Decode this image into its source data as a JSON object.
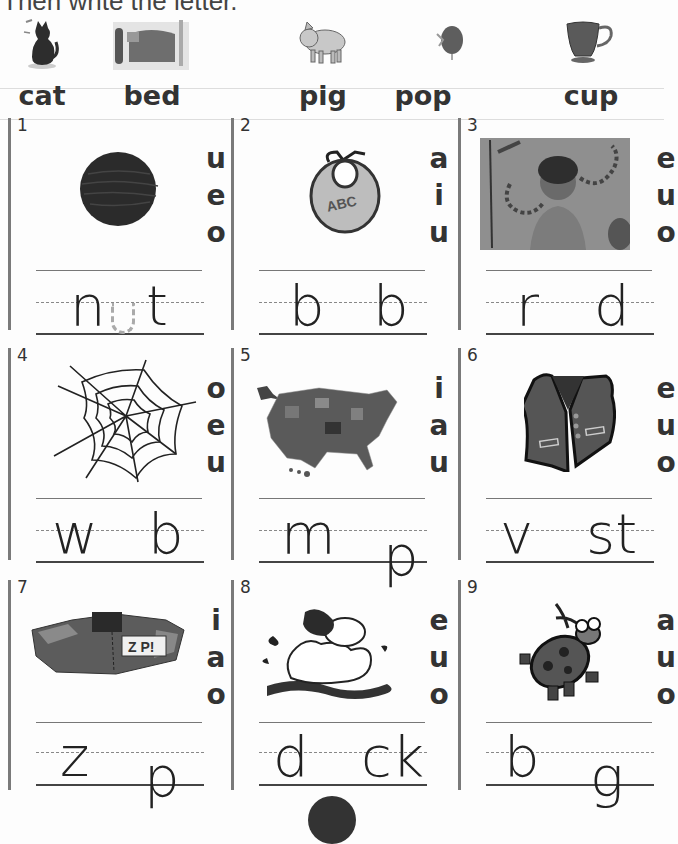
{
  "instruction": "Then write the letter.",
  "key_words": [
    {
      "word": "cat",
      "picture": "cat-icon"
    },
    {
      "word": "bed",
      "picture": "bed-icon"
    },
    {
      "word": "pig",
      "picture": "pig-icon"
    },
    {
      "word": "pop",
      "picture": "balloon-pop-icon"
    },
    {
      "word": "cup",
      "picture": "cup-icon"
    }
  ],
  "items": [
    {
      "number": "1",
      "picture": "nut-icon",
      "choices": [
        "u",
        "e",
        "o"
      ],
      "before": "n",
      "after": "t",
      "answer_traced": "u"
    },
    {
      "number": "2",
      "picture": "bib-icon",
      "bib_text": "ABC",
      "choices": [
        "a",
        "i",
        "u"
      ],
      "before": "b",
      "after": "b"
    },
    {
      "number": "3",
      "picture": "boy-with-rod-icon",
      "choices": [
        "e",
        "u",
        "o"
      ],
      "before": "r",
      "after": "d"
    },
    {
      "number": "4",
      "picture": "spider-web-icon",
      "choices": [
        "o",
        "e",
        "u"
      ],
      "before": "w",
      "after": "b"
    },
    {
      "number": "5",
      "picture": "us-map-icon",
      "choices": [
        "i",
        "a",
        "u"
      ],
      "before": "m",
      "after": "p"
    },
    {
      "number": "6",
      "picture": "vest-icon",
      "choices": [
        "e",
        "u",
        "o"
      ],
      "before": "v",
      "after": "st"
    },
    {
      "number": "7",
      "picture": "zap-building-icon",
      "zap_text": "Z P!",
      "choices": [
        "i",
        "a",
        "o"
      ],
      "before": "z",
      "after": "p"
    },
    {
      "number": "8",
      "picture": "duck-icon",
      "choices": [
        "e",
        "u",
        "o"
      ],
      "before": "d",
      "after": "ck"
    },
    {
      "number": "9",
      "picture": "bug-icon",
      "choices": [
        "a",
        "u",
        "o"
      ],
      "before": "b",
      "after": "g"
    }
  ]
}
